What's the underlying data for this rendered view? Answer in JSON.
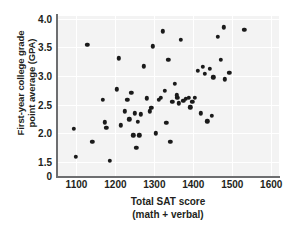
{
  "chart_data": {
    "type": "scatter",
    "title": "",
    "xlabel": "Total SAT score (math + verbal)",
    "xlabel_line1": "Total SAT score",
    "xlabel_line2": "(math + verbal)",
    "ylabel": "First-year college grade point average (GPA)",
    "ylabel_line1": "First-year college grade",
    "ylabel_line2": "point average (GPA)",
    "xlim": [
      1050,
      1620
    ],
    "ylim": [
      1.25,
      4.05
    ],
    "xticks": [
      1100,
      1200,
      1300,
      1400,
      1500,
      1600
    ],
    "xticklabels": [
      "1100",
      "1200",
      "1300",
      "1400",
      "1500",
      "1600"
    ],
    "yticks": [
      1.5,
      2.0,
      2.5,
      3.0,
      3.5,
      4.0
    ],
    "yticklabels": [
      "1.5",
      "2.0",
      "2.5",
      "3.0",
      "3.5",
      "4.0"
    ],
    "y_origin_label": "0",
    "grid": true,
    "legend": null,
    "marker": "filled-circle",
    "marker_color": "#1a1a1a",
    "plot_background": "#f3f3f3",
    "gridline_color": "#ffffff",
    "axis_color": "#6d6e70",
    "n_points": 60,
    "points": [
      [
        1093,
        2.08
      ],
      [
        1098,
        1.59
      ],
      [
        1128,
        3.55
      ],
      [
        1141,
        1.85
      ],
      [
        1168,
        2.58
      ],
      [
        1172,
        2.19
      ],
      [
        1177,
        2.09
      ],
      [
        1186,
        1.52
      ],
      [
        1203,
        2.77
      ],
      [
        1209,
        3.31
      ],
      [
        1214,
        2.14
      ],
      [
        1224,
        2.38
      ],
      [
        1231,
        2.58
      ],
      [
        1236,
        2.24
      ],
      [
        1241,
        2.71
      ],
      [
        1246,
        1.96
      ],
      [
        1249,
        2.35
      ],
      [
        1254,
        1.74
      ],
      [
        1261,
        1.96
      ],
      [
        1265,
        2.33
      ],
      [
        1273,
        3.17
      ],
      [
        1281,
        2.61
      ],
      [
        1288,
        2.38
      ],
      [
        1296,
        3.52
      ],
      [
        1303,
        2.0
      ],
      [
        1311,
        2.58
      ],
      [
        1316,
        2.62
      ],
      [
        1321,
        3.78
      ],
      [
        1327,
        2.74
      ],
      [
        1331,
        2.18
      ],
      [
        1336,
        3.28
      ],
      [
        1341,
        1.85
      ],
      [
        1346,
        2.55
      ],
      [
        1352,
        2.86
      ],
      [
        1359,
        2.62
      ],
      [
        1363,
        2.52
      ],
      [
        1368,
        3.63
      ],
      [
        1374,
        2.57
      ],
      [
        1381,
        2.6
      ],
      [
        1389,
        2.62
      ],
      [
        1397,
        2.55
      ],
      [
        1404,
        2.62
      ],
      [
        1412,
        3.09
      ],
      [
        1419,
        2.35
      ],
      [
        1424,
        3.16
      ],
      [
        1429,
        3.04
      ],
      [
        1436,
        2.21
      ],
      [
        1443,
        3.13
      ],
      [
        1451,
        2.98
      ],
      [
        1463,
        3.69
      ],
      [
        1471,
        3.28
      ],
      [
        1478,
        3.85
      ],
      [
        1481,
        2.94
      ],
      [
        1492,
        3.06
      ],
      [
        1531,
        3.81
      ],
      [
        1258,
        2.2
      ],
      [
        1292,
        2.44
      ],
      [
        1358,
        2.66
      ],
      [
        1392,
        2.45
      ],
      [
        1447,
        2.3
      ]
    ]
  }
}
